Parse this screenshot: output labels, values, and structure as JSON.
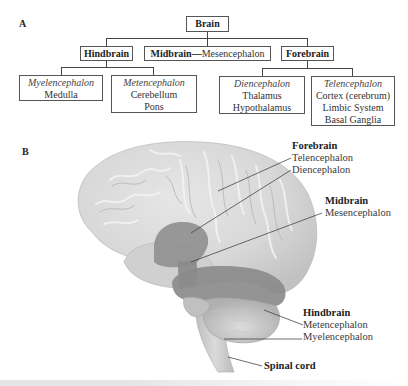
{
  "panel_a": {
    "label": "A",
    "root": {
      "label": "Brain"
    },
    "divisions": [
      {
        "name": "Hindbrain"
      },
      {
        "name": "Midbrain",
        "dash": "—",
        "alias": "Mesencephalon"
      },
      {
        "name": "Forebrain"
      }
    ],
    "subdivisions": {
      "hindbrain": [
        {
          "title": "Myelencephalon",
          "items": [
            "Medulla"
          ]
        },
        {
          "title": "Metencephalon",
          "items": [
            "Cerebellum",
            "Pons"
          ]
        }
      ],
      "forebrain": [
        {
          "title": "Diencephalon",
          "items": [
            "Thalamus",
            "Hypothalamus"
          ]
        },
        {
          "title": "Telencephalon",
          "items": [
            "Cortex (cerebrum)",
            "Limbic System",
            "Basal Ganglia"
          ]
        }
      ]
    }
  },
  "panel_b": {
    "label": "B",
    "labels": {
      "forebrain_heading": "Forebrain",
      "telencephalon": "Telencephalon",
      "diencephalon": "Diencephalon",
      "midbrain_heading": "Midbrain",
      "mesencephalon": "Mesencephalon",
      "hindbrain_heading": "Hindbrain",
      "metencephalon": "Metencephalon",
      "myelencephalon": "Myelencephalon",
      "spinal_cord": "Spinal cord"
    }
  },
  "colors": {
    "brain_light": "#d9d9d9",
    "brain_mid": "#c4c4c4",
    "highlight_dark": "#8e8e8e",
    "line": "#444444"
  }
}
